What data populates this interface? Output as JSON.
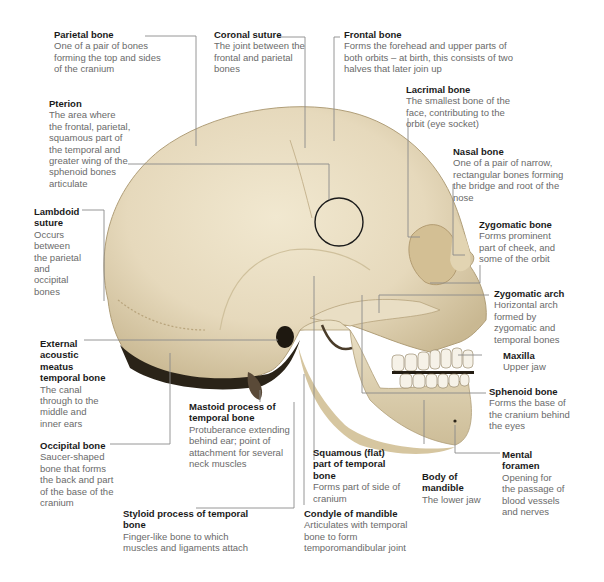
{
  "figure": {
    "colors": {
      "bone": "#e8dcc0",
      "bone_shadow": "#b8a684",
      "leader_line": "#8a8a8a",
      "title_text": "#1a1a1a",
      "body_text": "#6a6a6a",
      "highlight_circle": "#1a1a1a"
    }
  },
  "labels": {
    "parietal": {
      "title": "Parietal bone",
      "desc": "One of a pair of bones forming the top and sides of the cranium"
    },
    "coronal": {
      "title": "Coronal suture",
      "desc": "The joint between the frontal and parietal bones"
    },
    "frontal": {
      "title": "Frontal bone",
      "desc": "Forms the forehead and upper parts of both orbits – at birth, this consists of two halves that later join up"
    },
    "lacrimal": {
      "title": "Lacrimal bone",
      "desc": "The smallest bone of the face, contributing to the orbit (eye socket)"
    },
    "pterion": {
      "title": "Pterion",
      "desc": "The area where the frontal, parietal, squamous part of the temporal and greater wing of the sphenoid bones articulate"
    },
    "nasal": {
      "title": "Nasal bone",
      "desc": "One of a pair of narrow, rectangular bones forming the bridge and root of the nose"
    },
    "lambdoid": {
      "title": "Lambdoid suture",
      "desc": "Occurs between the parietal and occipital bones"
    },
    "zygomatic_bone": {
      "title": "Zygomatic bone",
      "desc": "Forms prominent part of cheek, and some of the orbit"
    },
    "zygomatic_arch": {
      "title": "Zygomatic arch",
      "desc": "Horizontal arch formed by zygomatic and temporal bones"
    },
    "external_acoustic": {
      "title": "External acoustic meatus temporal bone",
      "desc": "The canal through to the middle and inner ears"
    },
    "maxilla": {
      "title": "Maxilla",
      "desc": "Upper jaw"
    },
    "sphenoid": {
      "title": "Sphenoid bone",
      "desc": "Forms the base of the cranium behind the eyes"
    },
    "mastoid": {
      "title": "Mastoid process of temporal bone",
      "desc": "Protuberance extending behind ear; point of attachment for several neck muscles"
    },
    "occipital": {
      "title": "Occipital bone",
      "desc": "Saucer-shaped bone that forms the back and part of the base of the cranium"
    },
    "mental_foramen": {
      "title": "Mental foramen",
      "desc": "Opening for the passage of blood vessels and nerves"
    },
    "squamous": {
      "title": "Squamous (flat) part of temporal bone",
      "desc": "Forms part of side of cranium"
    },
    "body_mandible": {
      "title": "Body of mandible",
      "desc": "The lower jaw"
    },
    "styloid": {
      "title": "Styloid process of temporal bone",
      "desc": "Finger-like bone to which muscles and ligaments attach"
    },
    "condyle": {
      "title": "Condyle of mandible",
      "desc": "Articulates with temporal bone to form temporomandibular joint"
    }
  }
}
